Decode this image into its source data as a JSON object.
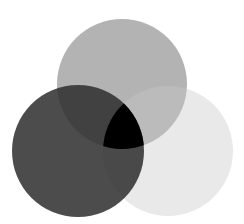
{
  "diagram": {
    "type": "venn",
    "width": 244,
    "height": 224,
    "background": "#ffffff",
    "circles": [
      {
        "id": "top",
        "cx": 122,
        "cy": 84,
        "r": 65,
        "fill": "#8f8f8f",
        "opacity": 0.68
      },
      {
        "id": "right",
        "cx": 168,
        "cy": 151,
        "r": 65,
        "fill": "#c8c8c8",
        "opacity": 0.4
      },
      {
        "id": "left",
        "cx": 78,
        "cy": 151,
        "r": 66,
        "fill": "#2e2e2e",
        "opacity": 0.86
      }
    ],
    "center_overlap_fill": "#000000"
  }
}
